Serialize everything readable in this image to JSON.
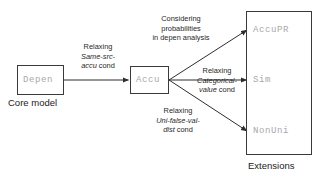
{
  "diagram": {
    "title_absent": "",
    "core": {
      "box_label": "Depen",
      "caption": "Core model"
    },
    "middle": {
      "box_label": "Accu"
    },
    "extensions": {
      "caption": "Extensions",
      "items": [
        {
          "label": "AccuPR"
        },
        {
          "label": "Sim"
        },
        {
          "label": "NonUni"
        }
      ]
    },
    "edges": [
      {
        "name": "depen-to-accu",
        "line1": "Relaxing",
        "line2_italic": "Same-src-",
        "line3_italic": "accu",
        "line3_rest": " cond"
      },
      {
        "name": "accu-to-accupr",
        "line1": "Considering",
        "line2": "probabilities",
        "line3": "in depen analysis"
      },
      {
        "name": "accu-to-sim",
        "line1": "Relaxing",
        "line2_italic": "Categorical-",
        "line3_italic": "value",
        "line3_rest": " cond"
      },
      {
        "name": "accu-to-nonuni",
        "line1": "Relaxing",
        "line2_italic": "Uni-false-val-",
        "line3_italic": "dist",
        "line3_rest": " cond"
      }
    ],
    "colors": {
      "stroke": "#3a3a3a",
      "code_text": "#a8a8a8",
      "text": "#1a1a1a",
      "background": "#ffffff"
    }
  }
}
